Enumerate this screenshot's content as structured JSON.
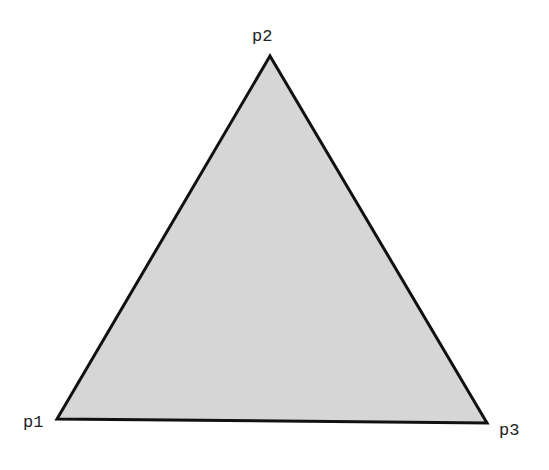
{
  "diagram": {
    "type": "triangle",
    "fill_color": "#d6d6d6",
    "stroke_color": "#111111",
    "vertices": [
      {
        "id": "p1",
        "label": "p1",
        "x": 57,
        "y": 419
      },
      {
        "id": "p2",
        "label": "p2",
        "x": 270,
        "y": 56
      },
      {
        "id": "p3",
        "label": "p3",
        "x": 487,
        "y": 423
      }
    ]
  }
}
